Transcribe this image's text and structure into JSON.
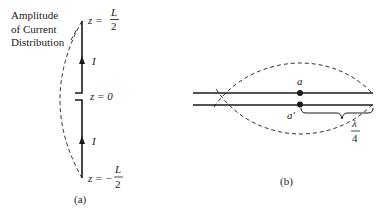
{
  "figure": {
    "panel_a": {
      "caption": "(a)",
      "amplitude_label_lines": [
        "Amplitude",
        "of Current",
        "Distribution"
      ],
      "z_top": {
        "prefix": "z =",
        "num": "L",
        "den": "2"
      },
      "z_mid": {
        "text": "z = 0"
      },
      "z_bottom": {
        "prefix": "z = −",
        "num": "L",
        "den": "2"
      },
      "current_label_top": "I",
      "current_label_bottom": "I"
    },
    "panel_b": {
      "caption": "(b)",
      "point_top": "a",
      "point_bottom": "a′",
      "length_label": {
        "num": "λ",
        "den": "4"
      }
    },
    "colors": {
      "ink": "#1a1a1a",
      "background": "#ffffff"
    }
  }
}
